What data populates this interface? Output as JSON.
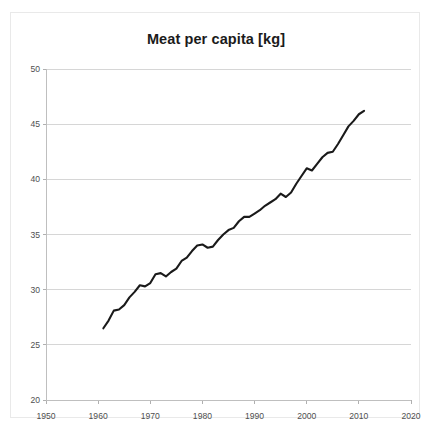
{
  "chart": {
    "title": "Meat per capita [kg]"
  },
  "chart_data": {
    "type": "line",
    "title": "Meat per capita [kg]",
    "xlabel": "",
    "ylabel": "",
    "xlim": [
      1950,
      2020
    ],
    "ylim": [
      20,
      50
    ],
    "xticks": [
      1950,
      1960,
      1970,
      1980,
      1990,
      2000,
      2010,
      2020
    ],
    "yticks": [
      20,
      25,
      30,
      35,
      40,
      45,
      50
    ],
    "grid": "horizontal",
    "legend": null,
    "line_color": "#1a1a1a",
    "grid_color": "#d6d6d6",
    "series": [
      {
        "name": "Meat per capita",
        "x": [
          1961,
          1962,
          1963,
          1964,
          1965,
          1966,
          1967,
          1968,
          1969,
          1970,
          1971,
          1972,
          1973,
          1974,
          1975,
          1976,
          1977,
          1978,
          1979,
          1980,
          1981,
          1982,
          1983,
          1984,
          1985,
          1986,
          1987,
          1988,
          1989,
          1990,
          1991,
          1992,
          1993,
          1994,
          1995,
          1996,
          1997,
          1998,
          1999,
          2000,
          2001,
          2002,
          2003,
          2004,
          2005,
          2006,
          2007,
          2008,
          2009,
          2010,
          2011
        ],
        "values": [
          26.5,
          27.2,
          28.1,
          28.2,
          28.6,
          29.3,
          29.8,
          30.4,
          30.3,
          30.6,
          31.4,
          31.5,
          31.2,
          31.6,
          31.9,
          32.6,
          32.9,
          33.5,
          34.0,
          34.1,
          33.8,
          33.9,
          34.5,
          35.0,
          35.4,
          35.6,
          36.2,
          36.6,
          36.6,
          36.9,
          37.2,
          37.6,
          37.9,
          38.2,
          38.7,
          38.4,
          38.8,
          39.6,
          40.3,
          41.0,
          40.8,
          41.4,
          42.0,
          42.4,
          42.5,
          43.2,
          44.0,
          44.8,
          45.3,
          45.9,
          46.2
        ]
      }
    ]
  }
}
